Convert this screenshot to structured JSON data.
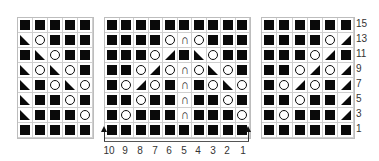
{
  "legend": {
    "K": "filled square (knit)",
    "O": "circle (yarn over)",
    "L": "left triangle (k2tog left-lean)",
    "R": "right triangle (ssk right-lean)",
    "C": "arch (centered double decrease)"
  },
  "grids": {
    "left": {
      "rows": [
        "KKKKK",
        "LOKKK",
        "KLOKK",
        "LOLOK",
        "LKOLO",
        "LKKOK",
        "LKKKO",
        "KKKKK"
      ]
    },
    "middle": {
      "rows": [
        "KKKKKKKKKK",
        "KKKKOCOKKK",
        "KKKORKLOKK",
        "KKOROCOLOK",
        "KOROKCKOLO",
        "KKOKKCKKOK",
        "KOKKKCKKKO",
        "KKKKKKKKKK"
      ]
    },
    "right": {
      "rows": [
        "KKKKKK",
        "KKKKOR",
        "KKKORK",
        "KKOROR",
        "KOROKR",
        "KKOKKR",
        "KOKKKR",
        "KKKKKK"
      ]
    }
  },
  "row_numbers": [
    "15",
    "13",
    "11",
    "9",
    "7",
    "5",
    "3",
    "1"
  ],
  "stitch_numbers": [
    "10",
    "9",
    "8",
    "7",
    "6",
    "5",
    "4",
    "3",
    "2",
    "1"
  ]
}
